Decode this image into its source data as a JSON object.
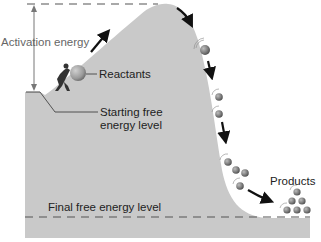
{
  "labels": {
    "activation_energy": "Activation energy",
    "reactants": "Reactants",
    "starting_line1": "Starting free",
    "starting_line2": "energy level",
    "products": "Products",
    "final": "Final free energy level"
  },
  "colors": {
    "terrain": "#c8c8c8",
    "dashes": "#555555",
    "arrow": "#111111",
    "ball": "#7a7a7a",
    "background": "#ffffff"
  }
}
